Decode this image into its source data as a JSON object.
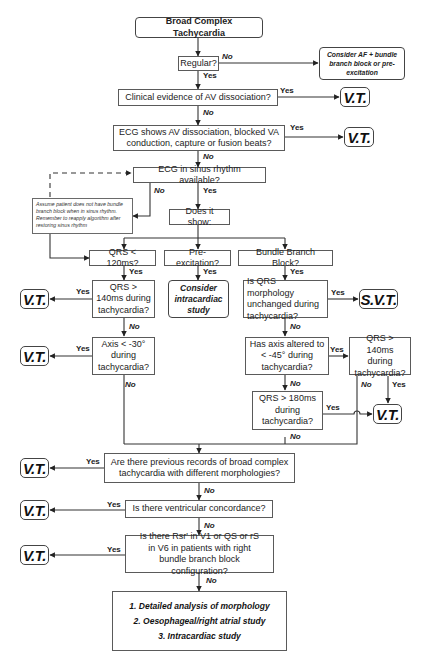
{
  "title": "Broad Complex Tachycardia",
  "nodes": {
    "start": "Broad Complex Tachycardia",
    "regular": "Regular?",
    "consider_af": "Consider AF + bundle branch block or pre-excitation",
    "clinical_av": "Clinical evidence of AV dissociation?",
    "ecg_av": "ECG shows AV dissociation, blocked VA conduction, capture or fusion beats?",
    "sinus_ecg": "ECG in sinus rhythm available?",
    "assume_note": "Assume patient does not have bundle branch block when in sinus rhythm. Remember to reapply algorithm after restoring sinus rhythm",
    "does_it_show": "Does it show:",
    "qrs_120": "QRS < 120ms?",
    "pre_excitation": "Pre-excitation?",
    "bbb": "Bundle Branch Block?",
    "qrs_140_left": "QRS > 140ms during tachycardia?",
    "consider_intracardiac": "Consider intracardiac study",
    "qrs_morph": "Is QRS morphology unchanged during tachycardia?",
    "axis_30": "Axis < -30° during tachycardia?",
    "axis_45": "Has axis altered to < -45° during tachycardia?",
    "qrs_140_right": "QRS > 140ms during tachycardia?",
    "qrs_180": "QRS > 180ms during tachycardia?",
    "prev_records": "Are there previous records of broad complex tachycardia with different morphologies?",
    "concordance": "Is there ventricular concordance?",
    "rsr": "Is there Rsr' in V1 or QS or rS in V6 in patients with right bundle branch block configuration?",
    "final": [
      "1. Detailed analysis of morphology",
      "2. Oesophageal/right atrial study",
      "3. Intracardiac study"
    ]
  },
  "outcomes": {
    "vt": "V.T.",
    "svt": "S.V.T."
  },
  "labels": {
    "yes": "Yes",
    "no": "No"
  }
}
